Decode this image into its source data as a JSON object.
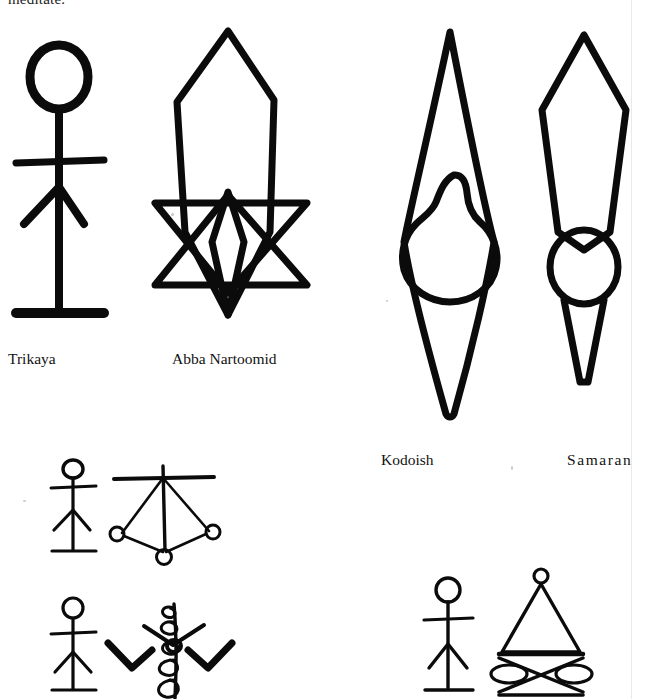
{
  "page": {
    "width": 646,
    "height": 699,
    "background": "#ffffff",
    "ink_color": "#000000",
    "text_color": "#121212",
    "top_partial_line": "meditate."
  },
  "captions": [
    {
      "key": "trikaya",
      "label": "Trikaya",
      "x": 8,
      "y": 350,
      "letterspaced": false
    },
    {
      "key": "abba",
      "label": "Abba  Nartoomid",
      "x": 172,
      "y": 350,
      "letterspaced": false
    },
    {
      "key": "kodoish",
      "label": "Kodoish",
      "x": 381,
      "y": 451,
      "letterspaced": false
    },
    {
      "key": "samaran",
      "label": "Samaran",
      "x": 567,
      "y": 451,
      "letterspaced": true
    }
  ],
  "figures": [
    {
      "key": "trikaya-stick-figure",
      "name": "Trikaya stick figure",
      "description": "Large stick figure: round open head, vertical body line, straight horizontal arms, inverted-V legs, horizontal ground bar",
      "x": 14,
      "y": 32,
      "w": 112,
      "h": 305,
      "parts": [
        "head-circle",
        "body-line",
        "arm-bar",
        "leg-v",
        "base-bar"
      ]
    },
    {
      "key": "abba-nartoomid-symbol",
      "name": "Abba Nartoomid symbol",
      "description": "Six-pointed hexagram (two overlapping triangles) with a tall elongated vesica flame shape overlaid vertically through the centre",
      "x": 150,
      "y": 27,
      "w": 170,
      "h": 313,
      "parts": [
        "hexagram-up-triangle",
        "hexagram-down-triangle",
        "vesica-flame-outer",
        "vesica-flame-inner"
      ]
    },
    {
      "key": "kodoish-symbol",
      "name": "Kodoish symbol",
      "description": "Tall vertical double-cone / lens outline with a bulbous teardrop flame form centred in the middle",
      "x": 388,
      "y": 30,
      "w": 120,
      "h": 385,
      "parts": [
        "double-cone-outline",
        "teardrop-flame"
      ]
    },
    {
      "key": "samaran-symbol",
      "name": "Samaran symbol",
      "description": "Elongated pentagon blade shape with pointed top, tapering to a narrow point, with an open circle centred at the waist",
      "x": 530,
      "y": 32,
      "w": 106,
      "h": 350,
      "parts": [
        "blade-outline",
        "waist-circle",
        "tail-point"
      ]
    },
    {
      "key": "small-figure-upper-left",
      "name": "Small stick figure (upper left pair)",
      "description": "Small stick figure with round head, arms bar, inverted-V legs and base bar",
      "x": 44,
      "y": 458,
      "w": 56,
      "h": 100,
      "parts": [
        "head-circle",
        "body-line",
        "arm-bar",
        "leg-v",
        "base-bar"
      ]
    },
    {
      "key": "tetrahedron-symbol",
      "name": "Tetrahedron symbol",
      "description": "Tetrahedron in perspective: apex with horizontal crossbar, three edges descending to small open circles at the base vertices, vertical mast through the centre",
      "x": 108,
      "y": 462,
      "w": 112,
      "h": 100,
      "parts": [
        "crossbar",
        "mast",
        "edge-left",
        "edge-right",
        "edge-front",
        "base-left-circle",
        "base-right-circle",
        "base-front-circle"
      ]
    },
    {
      "key": "small-figure-lower-left",
      "name": "Small stick figure (lower left pair)",
      "description": "Small stick figure with round head, arms bar, inverted-V legs and base bar",
      "x": 44,
      "y": 596,
      "w": 56,
      "h": 103,
      "parts": [
        "head-circle",
        "body-line",
        "arm-bar",
        "leg-v",
        "base-bar"
      ]
    },
    {
      "key": "caduceus-symbol",
      "name": "Caduceus / coiled staff symbol",
      "description": "Vertical staff wrapped by a continuous spiral coil, with two pairs of thick zigzag arms angling outward from the centre",
      "x": 108,
      "y": 598,
      "w": 130,
      "h": 101,
      "parts": [
        "staff",
        "spiral-coil",
        "upper-arms",
        "lower-arms"
      ]
    },
    {
      "key": "small-figure-lower-right",
      "name": "Small stick figure (lower right pair)",
      "description": "Small stick figure with round head, arms bar, inverted-V legs and base bar",
      "x": 418,
      "y": 576,
      "w": 58,
      "h": 123,
      "parts": [
        "head-circle",
        "body-line",
        "arm-bar",
        "leg-v",
        "base-bar"
      ]
    },
    {
      "key": "cone-bowtie-symbol",
      "name": "Cone and bowtie symbol",
      "description": "Narrow cone / pyramid topped by a small open circle, resting on a horizontal bar, below which is a crossed bowtie of two triangles with horizontal lens shapes at each side",
      "x": 482,
      "y": 566,
      "w": 116,
      "h": 133,
      "parts": [
        "apex-circle",
        "cone-outline",
        "base-bar",
        "bowtie-cross",
        "lens-left",
        "lens-right",
        "bottom-bar"
      ]
    }
  ]
}
